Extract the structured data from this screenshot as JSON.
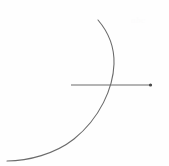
{
  "figure": {
    "background_color": "#fefefe",
    "width": 169,
    "height": 166,
    "watermark": {
      "text": "abc",
      "color": "#fcfcfc"
    },
    "elements": {
      "arc": {
        "label": "circular arc",
        "stroke_color": "#6b6b6b",
        "stroke_width": 1.1,
        "start_point": [
          98,
          20
        ],
        "end_point": [
          7,
          161
        ],
        "rightmost_point": [
          114,
          62
        ],
        "path": "M 98 20 C 110 34 114.5 48 114 64 C 113.2 88 100 118 74 139 C 55 154 28 161 7 161"
      },
      "horizontal_line": {
        "label": "horizontal line segment",
        "stroke_color": "#6b6b6b",
        "stroke_width": 1.1,
        "start_point": [
          71,
          85
        ],
        "end_point": [
          152,
          85
        ]
      },
      "endpoint_dot": {
        "label": "right endpoint marker",
        "fill_color": "#4a4a4a",
        "center": [
          150.5,
          85
        ],
        "radius": 1.6
      },
      "intersection_point": {
        "label": "arc and line intersection",
        "position": [
          109,
          85
        ]
      }
    }
  }
}
